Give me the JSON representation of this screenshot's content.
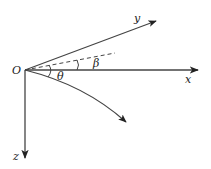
{
  "diagram": {
    "type": "coordinate-axes",
    "colors": {
      "stroke": "#333333",
      "text": "#222222",
      "background": "#ffffff"
    },
    "origin": {
      "label": "O"
    },
    "axes": [
      {
        "id": "x",
        "label": "x",
        "direction": "right"
      },
      {
        "id": "y",
        "label": "y",
        "direction": "up-right"
      },
      {
        "id": "z",
        "label": "z",
        "direction": "down"
      }
    ],
    "angles": [
      {
        "id": "beta",
        "label": "β",
        "between": [
          "dashed-line",
          "x"
        ]
      },
      {
        "id": "theta",
        "label": "θ",
        "between": [
          "x",
          "curved-trajectory"
        ]
      }
    ],
    "lines": [
      {
        "id": "dashed-line",
        "style": "dashed"
      },
      {
        "id": "curved-trajectory",
        "style": "solid-curve-arrow"
      }
    ]
  }
}
